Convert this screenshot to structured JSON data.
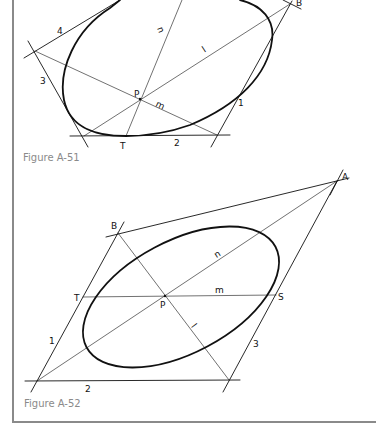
{
  "figures": [
    {
      "id": "fig-a51",
      "caption": "Figure A-51",
      "labels": {
        "B": "B",
        "P": "P",
        "T": "T",
        "n": "n",
        "l": "l",
        "m": "m",
        "t1": "1",
        "t2": "2",
        "t3": "3",
        "t4": "4"
      }
    },
    {
      "id": "fig-a52",
      "caption": "Figure A-52",
      "labels": {
        "A": "A",
        "B": "B",
        "P": "P",
        "T": "T",
        "S": "S",
        "n": "n",
        "m": "m",
        "l": "l",
        "t1": "1",
        "t2": "2",
        "t3": "3"
      }
    }
  ],
  "colors": {
    "line": "#111111",
    "border": "#8a8a8a",
    "caption": "#8a8a8a"
  }
}
